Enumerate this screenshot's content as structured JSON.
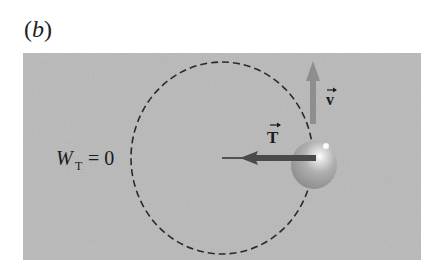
{
  "figure": {
    "panel_label_prefix": "(",
    "panel_label_letter": "b",
    "panel_label_suffix": ")",
    "work_label": {
      "symbol": "W",
      "subscript": "T",
      "equals": "= 0"
    },
    "tension_vector_label": "T",
    "velocity_vector_label": "v",
    "colors": {
      "background": "#b9b9b9",
      "circle_path": "#2a2a2a",
      "tension_arrow": "#4a4a4a",
      "velocity_arrow": "#8e8e8e",
      "ball": "#a8a8a8"
    }
  }
}
